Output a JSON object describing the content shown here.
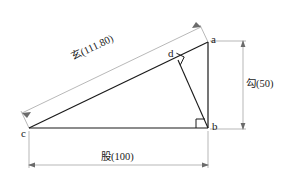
{
  "figure": {
    "type": "geometry-diagram",
    "background_color": "#ffffff",
    "stroke_color": "#1a1a1a",
    "dimension_line_color": "#9a9a9a"
  },
  "vertices": [
    {
      "id": "a",
      "label": "a",
      "x": 208,
      "y": 42
    },
    {
      "id": "b",
      "label": "b",
      "x": 208,
      "y": 128
    },
    {
      "id": "c",
      "label": "c",
      "x": 29,
      "y": 128
    },
    {
      "id": "d",
      "label": "d",
      "x": 178,
      "y": 60
    }
  ],
  "edges": [
    {
      "from": "c",
      "to": "a",
      "role": "hypotenuse"
    },
    {
      "from": "c",
      "to": "b",
      "role": "base-leg"
    },
    {
      "from": "a",
      "to": "b",
      "role": "vertical-leg"
    },
    {
      "from": "d",
      "to": "b",
      "role": "altitude"
    }
  ],
  "right_angles": [
    {
      "at": "b",
      "name": "right-angle-b"
    },
    {
      "at": "d",
      "name": "right-angle-d"
    }
  ],
  "dimensions": [
    {
      "id": "xuan",
      "name": "hypotenuse-dimension",
      "label": "玄(111.80)",
      "term": "玄",
      "value": "111.80",
      "orientation": "diagonal",
      "measures": "c-a"
    },
    {
      "id": "gou",
      "name": "vertical-leg-dimension",
      "label": "勾(50)",
      "term": "勾",
      "value": "50",
      "orientation": "vertical",
      "measures": "a-b"
    },
    {
      "id": "gu",
      "name": "base-leg-dimension",
      "label": "股(100)",
      "term": "股",
      "value": "100",
      "orientation": "horizontal",
      "measures": "c-b"
    }
  ]
}
